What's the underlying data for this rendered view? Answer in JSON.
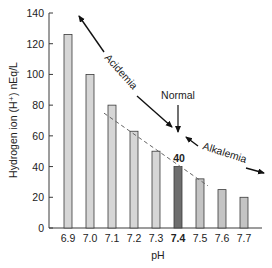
{
  "chart_data": {
    "type": "bar",
    "title": "",
    "xlabel": "pH",
    "ylabel": "Hydrogen ion (H⁺) nEq/L",
    "categories": [
      "6.9",
      "7.0",
      "7.1",
      "7.2",
      "7.3",
      "7.4",
      "7.5",
      "7.6",
      "7.7"
    ],
    "values": [
      126,
      100,
      80,
      63,
      50,
      40,
      32,
      25,
      20
    ],
    "ylim": [
      0,
      140
    ],
    "yticks": [
      0,
      20,
      40,
      60,
      80,
      100,
      120,
      140
    ],
    "highlight_category": "7.4",
    "highlight_value_label": "40",
    "grid": false,
    "legend": "none",
    "trendline": {
      "style": "dashed",
      "from_category": "7.1",
      "to_category": "7.5"
    },
    "annotations": {
      "acidemia": "Acidemia",
      "alkalemia": "Alkalemia",
      "normal": "Normal"
    },
    "colors": {
      "bar_fill": "#d6d6d6",
      "bar_fill_light": "#e2e2e2",
      "bar_fill_mid": "#c4c4c4",
      "highlight_fill": "#6e6e6e",
      "stroke": "#3a3a3a",
      "trend": "#666666",
      "text": "#222222"
    }
  }
}
